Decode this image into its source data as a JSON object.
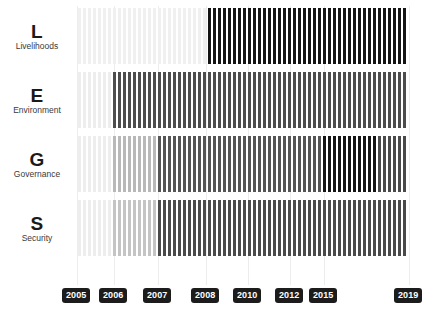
{
  "chart_data": {
    "type": "bar",
    "title": "",
    "subtitle": "",
    "xlabel": "",
    "ylabel": "",
    "grid": true,
    "legend_position": "none",
    "orientation": "vertical-stripes",
    "x_axis": {
      "start_year": 2005,
      "end_year": 2019,
      "tick_labels": [
        "2005",
        "2006",
        "2007",
        "2008",
        "2010",
        "2012",
        "2015",
        "2019"
      ],
      "tick_positions_px": [
        77,
        114,
        158,
        206,
        248,
        290,
        324,
        409
      ]
    },
    "bar_area": {
      "left_px": 78,
      "right_px": 409,
      "bar_count": 66,
      "bar_width_px": 3,
      "bar_gap_px": 2
    },
    "intensity_scale": {
      "very_light": "#f3f3f3",
      "light": "#e2e2e2",
      "medium_light": "#c9c9c9",
      "medium": "#8f8f8f",
      "medium_dark": "#4a4a4a",
      "dark": "#2b2b2b",
      "very_dark": "#111111"
    },
    "categories": [
      "2005",
      "2006",
      "2007",
      "2008",
      "2010",
      "2012",
      "2015",
      "2019"
    ],
    "series": [
      {
        "name": "Livelihoods",
        "letter": "L",
        "segments": [
          {
            "from_px": 78,
            "to_px": 205,
            "color": "#f0f0f0",
            "intensity": 0.05
          },
          {
            "from_px": 205,
            "to_px": 409,
            "color": "#141414",
            "intensity": 0.95
          }
        ],
        "values": [
          0.05,
          0.05,
          0.05,
          0.95,
          0.95,
          0.95,
          0.95,
          0.95
        ]
      },
      {
        "name": "Environment",
        "letter": "E",
        "segments": [
          {
            "from_px": 78,
            "to_px": 113,
            "color": "#ededed",
            "intensity": 0.07
          },
          {
            "from_px": 113,
            "to_px": 409,
            "color": "#4d4d4d",
            "intensity": 0.7
          }
        ],
        "values": [
          0.07,
          0.7,
          0.7,
          0.7,
          0.7,
          0.7,
          0.7,
          0.7
        ]
      },
      {
        "name": "Governance",
        "letter": "G",
        "segments": [
          {
            "from_px": 78,
            "to_px": 113,
            "color": "#ededed",
            "intensity": 0.07
          },
          {
            "from_px": 113,
            "to_px": 157,
            "color": "#b8b8b8",
            "intensity": 0.28
          },
          {
            "from_px": 157,
            "to_px": 320,
            "color": "#555555",
            "intensity": 0.66
          },
          {
            "from_px": 320,
            "to_px": 375,
            "color": "#141414",
            "intensity": 0.95
          },
          {
            "from_px": 375,
            "to_px": 409,
            "color": "#4a4a4a",
            "intensity": 0.71
          }
        ],
        "values": [
          0.07,
          0.28,
          0.66,
          0.66,
          0.66,
          0.66,
          0.95,
          0.71
        ]
      },
      {
        "name": "Security",
        "letter": "S",
        "segments": [
          {
            "from_px": 78,
            "to_px": 113,
            "color": "#ededed",
            "intensity": 0.07
          },
          {
            "from_px": 113,
            "to_px": 157,
            "color": "#c4c4c4",
            "intensity": 0.24
          },
          {
            "from_px": 157,
            "to_px": 409,
            "color": "#4a4a4a",
            "intensity": 0.71
          }
        ],
        "values": [
          0.07,
          0.24,
          0.71,
          0.71,
          0.71,
          0.71,
          0.71,
          0.71
        ]
      }
    ]
  },
  "rows": [
    {
      "letter": "L",
      "name": "Livelihoods",
      "top_px": 8
    },
    {
      "letter": "E",
      "name": "Environment",
      "top_px": 72
    },
    {
      "letter": "G",
      "name": "Governance",
      "top_px": 136
    },
    {
      "letter": "S",
      "name": "Security",
      "top_px": 200
    }
  ],
  "axis": {
    "years": [
      {
        "label": "2005",
        "x_px": 77,
        "chip_left_px": 62
      },
      {
        "label": "2006",
        "x_px": 114,
        "chip_left_px": 99
      },
      {
        "label": "2007",
        "x_px": 158,
        "chip_left_px": 143
      },
      {
        "label": "2008",
        "x_px": 206,
        "chip_left_px": 191
      },
      {
        "label": "2010",
        "x_px": 248,
        "chip_left_px": 233
      },
      {
        "label": "2012",
        "x_px": 290,
        "chip_left_px": 275
      },
      {
        "label": "2015",
        "x_px": 324,
        "chip_left_px": 309
      },
      {
        "label": "2019",
        "x_px": 409,
        "chip_left_px": 394
      }
    ]
  },
  "colors": {
    "background": "#ffffff",
    "gridline": "#ededed",
    "chip_background": "#1c1c1c",
    "chip_text": "#ffffff",
    "letter_text": "#1a1a1a",
    "name_text": "#3a3a3a"
  }
}
